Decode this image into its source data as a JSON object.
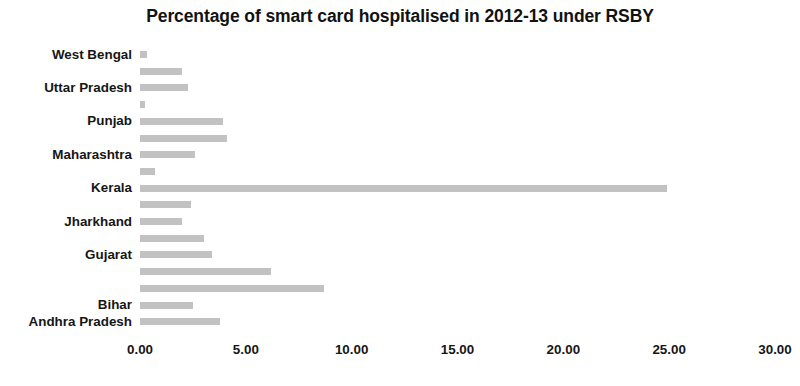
{
  "chart_data": {
    "type": "bar",
    "orientation": "horizontal",
    "title": "Percentage of smart card hospitalised in 2012-13 under RSBY",
    "xlabel": "",
    "ylabel": "",
    "xlim": [
      0,
      30
    ],
    "xticks": [
      "0.00",
      "5.00",
      "10.00",
      "15.00",
      "20.00",
      "25.00",
      "30.00"
    ],
    "xtick_values": [
      0,
      5,
      10,
      15,
      20,
      25,
      30
    ],
    "grid": false,
    "legend": false,
    "bar_color": "#bfbfbf",
    "categories": [
      "West Bengal",
      "",
      "Uttar Pradesh",
      "",
      "Punjab",
      "",
      "Maharashtra",
      "",
      "Kerala",
      "",
      "Jharkhand",
      "",
      "Gujarat",
      "",
      "",
      "Bihar",
      "Andhra Pradesh"
    ],
    "values": [
      0.33,
      2.0,
      2.25,
      0.25,
      3.9,
      4.1,
      2.6,
      0.7,
      24.9,
      2.4,
      2.0,
      3.0,
      3.4,
      6.2,
      8.7,
      2.5,
      3.8
    ],
    "visible_axis_labels": [
      "West Bengal",
      "Uttar Pradesh",
      "Punjab",
      "Maharashtra",
      "Kerala",
      "Jharkhand",
      "Gujarat",
      "Bihar",
      "Andhra Pradesh"
    ]
  }
}
